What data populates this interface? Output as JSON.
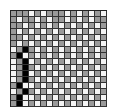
{
  "grid": {
    "cols": 16,
    "rows": 16,
    "colors": {
      "g": "#9a9a9a",
      "w": "#f4f4f4",
      "b": "#000000"
    },
    "cells": [
      "gggwgwgggwgwgwgw",
      "gwggwgwggwgwgwgg",
      "ggwgwgwgwgwgwgwg",
      "gwgwgwgwgwgwgwgw",
      "ggwgwgwgwgwgwgwg",
      "gwgwgwgwgwgwgwgw",
      "wgbgwgwgwgwgwgwg",
      "gbwgwgwgwgwgwgwg",
      "wgbwgwgwgwgwgwgw",
      "wgbgwgwgwgwgwgwg",
      "wgbwgwgwgwgwgwgw",
      "wgbgwgwgwgwgwgwg",
      "gbwwgwgwgwgwgwgw",
      "wgbgwgwgwgwgwgwg",
      "gbwwgwgwgwgwgwgw",
      "gbwgwgwgwgwgwgwg"
    ]
  }
}
